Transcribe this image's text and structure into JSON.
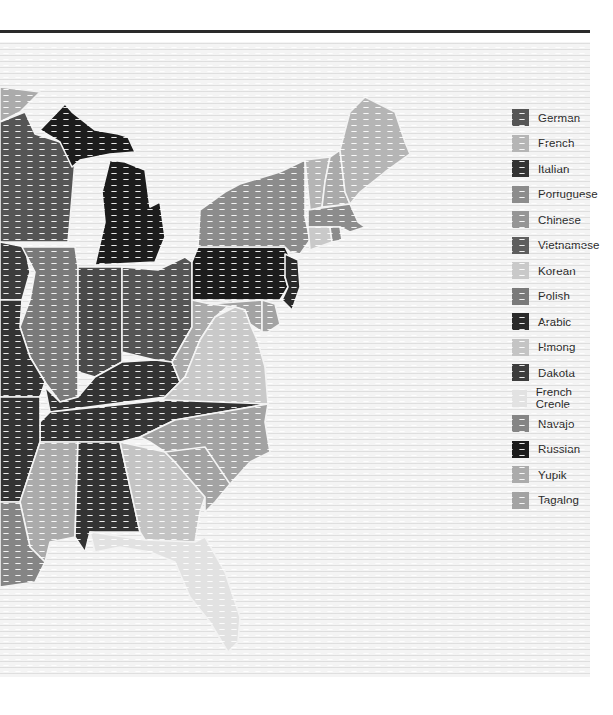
{
  "map": {
    "title": "",
    "region": "Eastern United States",
    "legend": [
      {
        "label": "German",
        "color": "#555555"
      },
      {
        "label": "French",
        "color": "#b5b5b5"
      },
      {
        "label": "Italian",
        "color": "#333333"
      },
      {
        "label": "Portuguese",
        "color": "#8c8c8c"
      },
      {
        "label": "Chinese",
        "color": "#959595"
      },
      {
        "label": "Vietnamese",
        "color": "#5e5e5e"
      },
      {
        "label": "Korean",
        "color": "#c9c9c9"
      },
      {
        "label": "Polish",
        "color": "#7a7a7a"
      },
      {
        "label": "Arabic",
        "color": "#2a2a2a"
      },
      {
        "label": "Hmong",
        "color": "#c4c4c4"
      },
      {
        "label": "Dakota",
        "color": "#3c3c3c"
      },
      {
        "label": "French Creole",
        "color": "#e2e2e2"
      },
      {
        "label": "Navajo",
        "color": "#858585"
      },
      {
        "label": "Russian",
        "color": "#1c1c1c"
      },
      {
        "label": "Yupik",
        "color": "#ababab"
      },
      {
        "label": "Tagalog",
        "color": "#a3a3a3"
      }
    ],
    "states": [
      {
        "name": "Minnesota",
        "language": "Yupik",
        "color": "#ababab"
      },
      {
        "name": "Wisconsin",
        "language": "German",
        "color": "#555555"
      },
      {
        "name": "Michigan",
        "language": "Russian",
        "color": "#1c1c1c"
      },
      {
        "name": "Iowa",
        "language": "Dakota",
        "color": "#3c3c3c"
      },
      {
        "name": "Illinois",
        "language": "Polish",
        "color": "#7a7a7a"
      },
      {
        "name": "Indiana",
        "language": "German",
        "color": "#4a4a4a"
      },
      {
        "name": "Ohio",
        "language": "German",
        "color": "#555555"
      },
      {
        "name": "Pennsylvania",
        "language": "Russian",
        "color": "#1c1c1c"
      },
      {
        "name": "New York",
        "language": "Portuguese",
        "color": "#8c8c8c"
      },
      {
        "name": "Vermont",
        "language": "French",
        "color": "#b5b5b5"
      },
      {
        "name": "New Hampshire",
        "language": "French",
        "color": "#aaaaaa"
      },
      {
        "name": "Maine",
        "language": "French",
        "color": "#b5b5b5"
      },
      {
        "name": "Massachusetts",
        "language": "Portuguese",
        "color": "#8c8c8c"
      },
      {
        "name": "Connecticut",
        "language": "Korean",
        "color": "#c9c9c9"
      },
      {
        "name": "Rhode Island",
        "language": "Portuguese",
        "color": "#8c8c8c"
      },
      {
        "name": "New Jersey",
        "language": "Arabic",
        "color": "#2a2a2a"
      },
      {
        "name": "Missouri",
        "language": "Italian",
        "color": "#333333"
      },
      {
        "name": "Kentucky",
        "language": "Italian",
        "color": "#333333"
      },
      {
        "name": "West Virginia",
        "language": "Yupik",
        "color": "#ababab"
      },
      {
        "name": "Virginia",
        "language": "Korean",
        "color": "#c9c9c9"
      },
      {
        "name": "Maryland",
        "language": "Tagalog",
        "color": "#a3a3a3"
      },
      {
        "name": "Delaware",
        "language": "Tagalog",
        "color": "#a3a3a3"
      },
      {
        "name": "Tennessee",
        "language": "Italian",
        "color": "#333333"
      },
      {
        "name": "North Carolina",
        "language": "Tagalog",
        "color": "#a3a3a3"
      },
      {
        "name": "Arkansas",
        "language": "Italian",
        "color": "#333333"
      },
      {
        "name": "Mississippi",
        "language": "Yupik",
        "color": "#ababab"
      },
      {
        "name": "Alabama",
        "language": "Italian",
        "color": "#333333"
      },
      {
        "name": "Georgia",
        "language": "Hmong",
        "color": "#c4c4c4"
      },
      {
        "name": "South Carolina",
        "language": "Tagalog",
        "color": "#a3a3a3"
      },
      {
        "name": "Louisiana",
        "language": "Navajo",
        "color": "#858585"
      },
      {
        "name": "Florida",
        "language": "French Creole",
        "color": "#e2e2e2"
      }
    ]
  }
}
